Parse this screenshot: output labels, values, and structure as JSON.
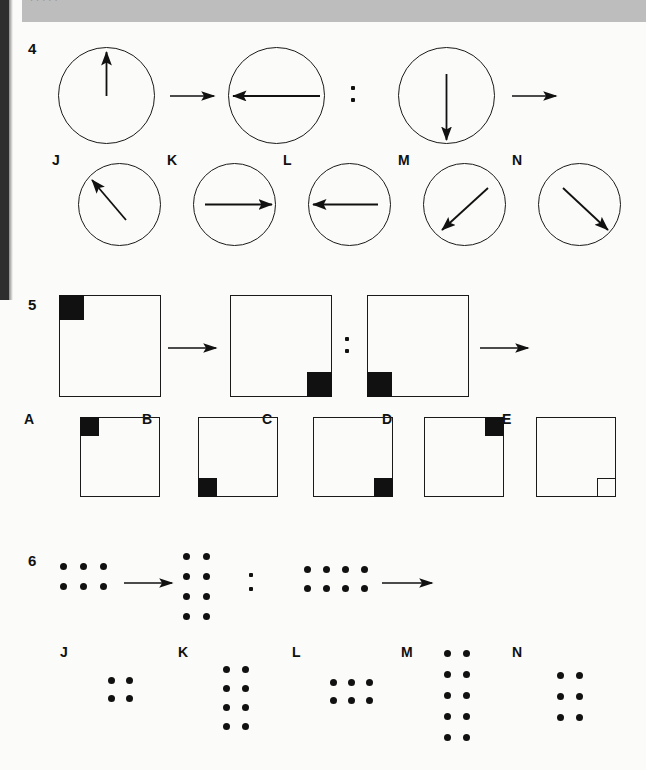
{
  "page": {
    "width": 646,
    "height": 770,
    "background_color": "#fbfbf9",
    "ink_color": "#111111",
    "header_band_color": "#bdbdbd",
    "header_band_text": "   . .                 ,      ,                                                             ."
  },
  "questions": [
    {
      "number": "4",
      "type": "circle-arrow-analogy",
      "stem": [
        {
          "role": "term-a",
          "shape": "circle",
          "arrow_direction": "up",
          "arrow_degrees": 90
        },
        {
          "role": "operator",
          "symbol": "arrow-right"
        },
        {
          "role": "term-b",
          "shape": "circle",
          "arrow_direction": "left",
          "arrow_degrees": 180
        },
        {
          "role": "separator",
          "symbol": "colon"
        },
        {
          "role": "term-c",
          "shape": "circle",
          "arrow_direction": "down",
          "arrow_degrees": 270
        },
        {
          "role": "operator",
          "symbol": "arrow-right"
        },
        {
          "role": "term-d",
          "shape": "blank"
        }
      ],
      "options": [
        {
          "letter": "J",
          "shape": "circle",
          "arrow_direction": "up-left",
          "arrow_degrees": 135
        },
        {
          "letter": "K",
          "shape": "circle",
          "arrow_direction": "right",
          "arrow_degrees": 0
        },
        {
          "letter": "L",
          "shape": "circle",
          "arrow_direction": "left",
          "arrow_degrees": 180
        },
        {
          "letter": "M",
          "shape": "circle",
          "arrow_direction": "down-left",
          "arrow_degrees": 225
        },
        {
          "letter": "N",
          "shape": "circle",
          "arrow_direction": "down-right",
          "arrow_degrees": 315
        }
      ]
    },
    {
      "number": "5",
      "type": "square-corner-analogy",
      "stem": [
        {
          "role": "term-a",
          "shape": "square",
          "corner": "top-left",
          "fill": "filled"
        },
        {
          "role": "operator",
          "symbol": "arrow-right"
        },
        {
          "role": "term-b",
          "shape": "square",
          "corner": "bottom-right",
          "fill": "filled"
        },
        {
          "role": "separator",
          "symbol": "colon"
        },
        {
          "role": "term-c",
          "shape": "square",
          "corner": "bottom-left",
          "fill": "filled"
        },
        {
          "role": "operator",
          "symbol": "arrow-right"
        },
        {
          "role": "term-d",
          "shape": "blank"
        }
      ],
      "options": [
        {
          "letter": "A",
          "shape": "square",
          "corner": "top-left",
          "fill": "filled"
        },
        {
          "letter": "B",
          "shape": "square",
          "corner": "bottom-left",
          "fill": "filled"
        },
        {
          "letter": "C",
          "shape": "square",
          "corner": "bottom-right",
          "fill": "filled"
        },
        {
          "letter": "D",
          "shape": "square",
          "corner": "top-right",
          "fill": "filled"
        },
        {
          "letter": "E",
          "shape": "square",
          "corner": "bottom-right",
          "fill": "outline"
        }
      ]
    },
    {
      "number": "6",
      "type": "dot-grid-analogy",
      "stem": [
        {
          "role": "term-a",
          "shape": "dot-grid",
          "columns": 3,
          "rows": 2,
          "count": 6
        },
        {
          "role": "operator",
          "symbol": "arrow-right"
        },
        {
          "role": "term-b",
          "shape": "dot-grid",
          "columns": 2,
          "rows": 4,
          "count": 8
        },
        {
          "role": "separator",
          "symbol": "colon"
        },
        {
          "role": "term-c",
          "shape": "dot-grid",
          "columns": 4,
          "rows": 2,
          "count": 8
        },
        {
          "role": "operator",
          "symbol": "arrow-right"
        },
        {
          "role": "term-d",
          "shape": "blank"
        }
      ],
      "options": [
        {
          "letter": "J",
          "shape": "dot-grid",
          "columns": 2,
          "rows": 2,
          "count": 4
        },
        {
          "letter": "K",
          "shape": "dot-grid",
          "columns": 2,
          "rows": 4,
          "count": 8
        },
        {
          "letter": "L",
          "shape": "dot-grid",
          "columns": 3,
          "rows": 2,
          "count": 6
        },
        {
          "letter": "M",
          "shape": "dot-grid",
          "columns": 2,
          "rows": 5,
          "count": 10
        },
        {
          "letter": "N",
          "shape": "dot-grid",
          "columns": 2,
          "rows": 3,
          "count": 6
        }
      ]
    }
  ]
}
